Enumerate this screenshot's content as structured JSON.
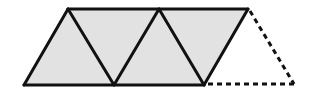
{
  "diagram": {
    "colors": {
      "fill": "#e2e2e2",
      "stroke": "#111111",
      "background": "#ffffff"
    },
    "triangles": [
      {
        "id": "t1",
        "points": "24,85 68,9 114,85",
        "style": "solid-shaded"
      },
      {
        "id": "t2",
        "points": "68,9 114,85 159,9",
        "style": "solid-shaded"
      },
      {
        "id": "t3",
        "points": "114,85 159,9 204,85",
        "style": "solid-shaded"
      },
      {
        "id": "t4",
        "points": "159,9 204,85 248,9",
        "style": "solid-shaded"
      },
      {
        "id": "t5",
        "points": "204,85 248,9 294,85",
        "style": "dashed-empty"
      }
    ]
  }
}
